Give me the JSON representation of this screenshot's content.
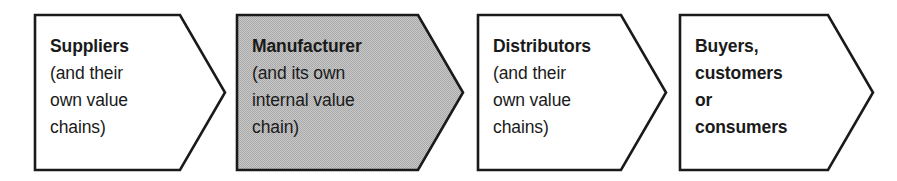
{
  "diagram": {
    "type": "process-chevron-chain",
    "canvas": {
      "width": 897,
      "height": 181
    },
    "colors": {
      "stroke": "#1a1a1a",
      "fill_plain": "#ffffff",
      "fill_highlight": "#bdbdbd",
      "text": "#1a1a1a",
      "background": "#ffffff"
    },
    "stages": [
      {
        "id": "suppliers",
        "header": "Suppliers",
        "sub_lines": [
          "(and their",
          "own value",
          "chains)"
        ],
        "highlighted": false,
        "sub_bold": false,
        "box": {
          "x": 35,
          "y": 15,
          "w": 190,
          "h": 155,
          "notch": 45
        },
        "text": {
          "x": 50,
          "y": 33
        }
      },
      {
        "id": "manufacturer",
        "header": "Manufacturer",
        "sub_lines": [
          "(and its own",
          "internal value",
          "chain)"
        ],
        "highlighted": true,
        "sub_bold": false,
        "box": {
          "x": 237,
          "y": 15,
          "w": 226,
          "h": 155,
          "notch": 45
        },
        "text": {
          "x": 252,
          "y": 33
        }
      },
      {
        "id": "distributors",
        "header": "Distributors",
        "sub_lines": [
          "(and their",
          "own value",
          "chains)"
        ],
        "highlighted": false,
        "sub_bold": false,
        "box": {
          "x": 478,
          "y": 15,
          "w": 188,
          "h": 155,
          "notch": 45
        },
        "text": {
          "x": 493,
          "y": 33
        }
      },
      {
        "id": "buyers",
        "header": "Buyers,",
        "sub_lines": [
          "customers",
          "or",
          "consumers"
        ],
        "highlighted": false,
        "sub_bold": true,
        "box": {
          "x": 680,
          "y": 15,
          "w": 193,
          "h": 155,
          "notch": 45
        },
        "text": {
          "x": 695,
          "y": 33
        }
      }
    ]
  }
}
